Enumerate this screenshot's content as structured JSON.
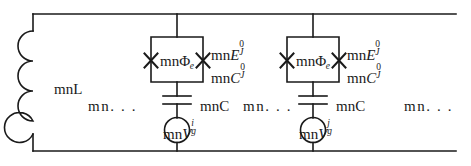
{
  "figure": {
    "name": "josephson-junction-array-circuit",
    "width": 471,
    "height": 166,
    "line_color": "#1a1a1a",
    "background": "#ffffff"
  },
  "inductor": {
    "label_prefix": "mn",
    "label_symbol": "L",
    "label": "mnL",
    "turns": 4
  },
  "ellipses": {
    "left": "mn. . .",
    "middle": "mn. . .",
    "right": "mn. . ."
  },
  "cells": [
    {
      "id": "cell-i",
      "flux_prefix": "mn",
      "flux_symbol": "Φ",
      "flux_subscript": "e",
      "junction_energy_prefix": "mn",
      "junction_energy_symbol": "E",
      "junction_energy_sup": "0",
      "junction_energy_sub": "J",
      "junction_cap_prefix": "mn",
      "junction_cap_symbol": "C",
      "junction_cap_sup": "0",
      "junction_cap_sub": "J",
      "gate_cap_prefix": "mn",
      "gate_cap_symbol": "C",
      "gate_cap_label": "mnC",
      "source_prefix": "mn",
      "source_symbol": "V",
      "source_sub": "g",
      "source_sup": "i",
      "junction_count": 2
    },
    {
      "id": "cell-j",
      "flux_prefix": "mn",
      "flux_symbol": "Φ",
      "flux_subscript": "e",
      "junction_energy_prefix": "mn",
      "junction_energy_symbol": "E",
      "junction_energy_sup": "0",
      "junction_energy_sub": "J",
      "junction_cap_prefix": "mn",
      "junction_cap_symbol": "C",
      "junction_cap_sup": "0",
      "junction_cap_sub": "J",
      "gate_cap_prefix": "mn",
      "gate_cap_symbol": "C",
      "gate_cap_label": "mnC",
      "source_prefix": "mn",
      "source_symbol": "V",
      "source_sub": "g",
      "source_sup": "j",
      "junction_count": 2
    }
  ]
}
